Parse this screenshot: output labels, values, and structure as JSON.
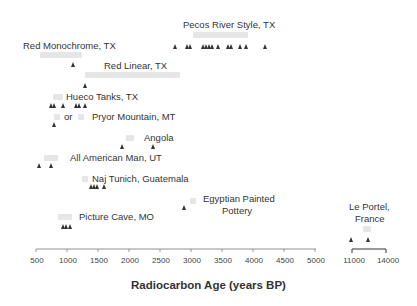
{
  "chart_data": {
    "type": "scatter",
    "title": "",
    "xlabel": "Radiocarbon Age (years BP)",
    "ylabel": "",
    "grid": false,
    "xaxis_segments": [
      {
        "range": [
          500,
          5000
        ],
        "ticks": [
          500,
          1000,
          1500,
          2000,
          2500,
          3000,
          3500,
          4000,
          4500,
          5000
        ]
      },
      {
        "range": [
          11000,
          14000
        ],
        "ticks": [
          11000,
          14000
        ]
      }
    ],
    "series": [
      {
        "name": "Pecos River Style, TX",
        "x": [
          2750,
          2950,
          3000,
          3200,
          3250,
          3300,
          3350,
          3450,
          3600,
          3650,
          3800,
          3900,
          4200
        ]
      },
      {
        "name": "Red Monochrome, TX",
        "x": [
          1100
        ]
      },
      {
        "name": "Red Linear, TX",
        "x": [
          1300
        ]
      },
      {
        "name": "Hueco Tanks, TX",
        "x": [
          750,
          800,
          950,
          1150,
          1200,
          1300
        ]
      },
      {
        "name": "Pryor Mountain, MT",
        "x": [
          800
        ]
      },
      {
        "name": "Angola",
        "x": [
          1900,
          2400
        ]
      },
      {
        "name": "All American Man, UT",
        "x": [
          550,
          750
        ]
      },
      {
        "name": "Naj Tunich, Guatemala",
        "x": [
          1400,
          1450,
          1500,
          1600
        ]
      },
      {
        "name": "Egyptian Painted Pottery",
        "x": [
          2900
        ]
      },
      {
        "name": "Picture Cave, MO",
        "x": [
          950,
          1000,
          1050
        ]
      },
      {
        "name": "Le Portel, France",
        "x": [
          11000,
          12500
        ]
      }
    ]
  },
  "labels": {
    "pecos": "Pecos River Style, TX",
    "red_mono": "Red Monochrome, TX",
    "red_linear": "Red Linear, TX",
    "hueco": "Hueco Tanks, TX",
    "or": "or",
    "pryor": "Pryor Mountain, MT",
    "angola": "Angola",
    "american": "All American Man, UT",
    "naj": "Naj Tunich, Guatemala",
    "egypt1": "Egyptian Painted",
    "egypt2": "Pottery",
    "picture": "Picture Cave, MO",
    "portel1": "Le Portel,",
    "portel2": "France"
  },
  "ticks": [
    "500",
    "1000",
    "1500",
    "2000",
    "2500",
    "3000",
    "3500",
    "4000",
    "4500",
    "5000",
    "11000",
    "14000"
  ]
}
